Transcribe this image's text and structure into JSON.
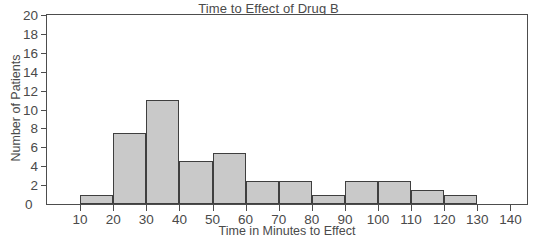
{
  "chart_data": {
    "type": "bar",
    "title": "Time to Effect of Drug B",
    "xlabel": "Time in Minutes to Effect",
    "ylabel": "Number of Patients",
    "grid": false,
    "legend": "none",
    "xlim": [
      0,
      145
    ],
    "ylim": [
      0,
      20
    ],
    "xticks": [
      0,
      10,
      20,
      30,
      40,
      50,
      60,
      70,
      80,
      90,
      100,
      110,
      120,
      130,
      140
    ],
    "xtick_labels": [
      "0",
      "10",
      "20",
      "30",
      "40",
      "50",
      "60",
      "70",
      "80",
      "90",
      "100",
      "110",
      "120",
      "130",
      "140"
    ],
    "yticks": [
      0,
      2,
      4,
      6,
      8,
      10,
      12,
      14,
      16,
      18,
      20
    ],
    "ytick_labels": [
      "0",
      "2",
      "4",
      "6",
      "8",
      "10",
      "12",
      "14",
      "16",
      "18",
      "20"
    ],
    "bin_width": 10,
    "categories": [
      "10-20",
      "20-30",
      "30-40",
      "40-50",
      "50-60",
      "60-70",
      "70-80",
      "80-90",
      "90-100",
      "100-110",
      "110-120",
      "120-130"
    ],
    "bins": [
      {
        "start": 10,
        "end": 20,
        "value": 1
      },
      {
        "start": 20,
        "end": 30,
        "value": 7.5
      },
      {
        "start": 30,
        "end": 40,
        "value": 11
      },
      {
        "start": 40,
        "end": 50,
        "value": 4.5
      },
      {
        "start": 50,
        "end": 60,
        "value": 5.4
      },
      {
        "start": 60,
        "end": 70,
        "value": 2.4
      },
      {
        "start": 70,
        "end": 80,
        "value": 2.4
      },
      {
        "start": 80,
        "end": 90,
        "value": 1
      },
      {
        "start": 90,
        "end": 100,
        "value": 2.4
      },
      {
        "start": 100,
        "end": 110,
        "value": 2.4
      },
      {
        "start": 110,
        "end": 120,
        "value": 1.5
      },
      {
        "start": 120,
        "end": 130,
        "value": 1
      }
    ],
    "values": [
      1,
      7.5,
      11,
      4.5,
      5.4,
      2.4,
      2.4,
      1,
      2.4,
      2.4,
      1.5,
      1
    ],
    "colors": {
      "bar_fill": "#c9c9c9",
      "bar_edge": "#3f3f3f",
      "axis": "#4d4d4d",
      "text": "#4a4a4a",
      "background": "#ffffff"
    }
  }
}
